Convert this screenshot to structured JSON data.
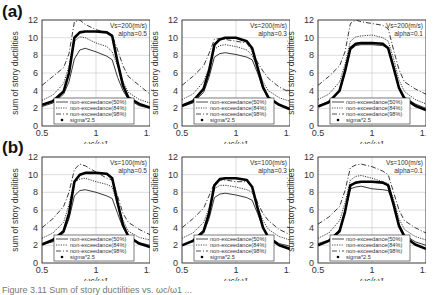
{
  "panels": [
    {
      "label": "(a)"
    },
    {
      "label": "(b)"
    }
  ],
  "caption": "Figure 3.11  Sum of story ductilities vs. ωc/ω1 ...",
  "chart_data": [
    {
      "type": "line",
      "panel": "(a)",
      "annotation": [
        "Vs=200(m/s)",
        "alpha=0.5"
      ],
      "xlabel": "ωc/ω1",
      "ylabel": "sum of story ductilities",
      "xlim": [
        0.5,
        1.5
      ],
      "ylim": [
        0,
        12
      ],
      "xticks": [
        0.5,
        1,
        1.5
      ],
      "yticks": [
        0,
        2,
        4,
        6,
        8,
        10,
        12
      ],
      "grid": true,
      "legend_position": "lower center",
      "x": [
        0.5,
        0.6,
        0.7,
        0.75,
        0.8,
        0.85,
        0.9,
        1.0,
        1.1,
        1.15,
        1.2,
        1.25,
        1.3,
        1.4,
        1.5
      ],
      "series": [
        {
          "name": "non-exceedance(50%)",
          "style": "solid",
          "values": [
            2.2,
            2.6,
            3.6,
            5.0,
            7.6,
            8.6,
            8.8,
            8.4,
            7.9,
            7.5,
            5.5,
            4.0,
            3.0,
            2.3,
            2.0
          ]
        },
        {
          "name": "non-exceedance(84%)",
          "style": "dotted",
          "values": [
            2.9,
            3.5,
            4.8,
            6.8,
            9.6,
            10.1,
            10.0,
            9.4,
            9.0,
            8.4,
            6.8,
            5.0,
            3.8,
            3.0,
            2.6
          ]
        },
        {
          "name": "non-exceedance(98%)",
          "style": "dashdot",
          "values": [
            4.6,
            5.6,
            6.6,
            8.2,
            11.8,
            12.0,
            11.5,
            10.9,
            10.6,
            10.3,
            8.6,
            6.8,
            5.6,
            4.6,
            3.6
          ]
        },
        {
          "name": "sigma*2.5",
          "style": "markers",
          "values": [
            2.4,
            2.8,
            3.9,
            6.0,
            10.0,
            10.6,
            10.7,
            10.7,
            10.6,
            10.2,
            7.2,
            4.6,
            3.2,
            2.5,
            2.1
          ]
        }
      ]
    },
    {
      "type": "line",
      "panel": "(a)",
      "annotation": [
        "Vs=200(m/s)",
        "alpha=0.3"
      ],
      "xlabel": "ωc/ω1",
      "ylabel": "sum of story ductilities",
      "xlim": [
        0.5,
        1.5
      ],
      "ylim": [
        0,
        12
      ],
      "xticks": [
        0.5,
        1,
        1.5
      ],
      "yticks": [
        0,
        2,
        4,
        6,
        8,
        10,
        12
      ],
      "grid": true,
      "legend_position": "lower center",
      "x": [
        0.5,
        0.6,
        0.7,
        0.75,
        0.8,
        0.85,
        0.9,
        1.0,
        1.1,
        1.15,
        1.2,
        1.25,
        1.3,
        1.4,
        1.5
      ],
      "series": [
        {
          "name": "non-exceedance(50%)",
          "style": "solid",
          "values": [
            2.2,
            2.6,
            3.8,
            5.5,
            7.8,
            8.2,
            8.3,
            8.1,
            7.8,
            7.5,
            6.0,
            4.2,
            3.1,
            2.4,
            2.0
          ]
        },
        {
          "name": "non-exceedance(84%)",
          "style": "dotted",
          "values": [
            3.0,
            3.6,
            5.0,
            6.6,
            8.7,
            9.1,
            9.2,
            9.0,
            8.6,
            8.0,
            6.5,
            5.0,
            4.0,
            3.2,
            2.8
          ]
        },
        {
          "name": "non-exceedance(98%)",
          "style": "dashdot",
          "values": [
            4.6,
            5.6,
            6.8,
            8.2,
            9.8,
            9.9,
            9.8,
            9.6,
            9.4,
            8.4,
            7.2,
            6.2,
            5.4,
            4.4,
            3.8
          ]
        },
        {
          "name": "sigma*2.5",
          "style": "markers",
          "values": [
            2.3,
            2.8,
            4.2,
            6.2,
            9.2,
            9.8,
            10.0,
            10.0,
            9.6,
            8.8,
            6.6,
            4.4,
            3.2,
            2.4,
            1.9
          ]
        }
      ]
    },
    {
      "type": "line",
      "panel": "(a)",
      "annotation": [
        "Vs=200(m/s)",
        "alpha=0.1"
      ],
      "xlabel": "ωc/ω1",
      "ylabel": "sum of story ductilities",
      "xlim": [
        0.5,
        1.5
      ],
      "ylim": [
        0,
        12
      ],
      "xticks": [
        0.5,
        1,
        1.5
      ],
      "yticks": [
        0,
        2,
        4,
        6,
        8,
        10,
        12
      ],
      "grid": true,
      "legend_position": "lower center",
      "x": [
        0.5,
        0.6,
        0.7,
        0.75,
        0.8,
        0.85,
        0.9,
        1.0,
        1.1,
        1.15,
        1.2,
        1.25,
        1.3,
        1.4,
        1.5
      ],
      "series": [
        {
          "name": "non-exceedance(50%)",
          "style": "solid",
          "values": [
            2.3,
            2.8,
            4.0,
            6.0,
            8.6,
            9.1,
            9.2,
            9.2,
            9.1,
            8.8,
            6.8,
            4.5,
            3.3,
            2.5,
            2.0
          ]
        },
        {
          "name": "non-exceedance(84%)",
          "style": "dotted",
          "values": [
            3.0,
            3.6,
            5.0,
            7.0,
            9.6,
            10.1,
            10.2,
            10.3,
            10.0,
            9.6,
            7.6,
            5.2,
            3.9,
            3.0,
            2.5
          ]
        },
        {
          "name": "non-exceedance(98%)",
          "style": "dashdot",
          "values": [
            4.6,
            5.6,
            6.8,
            8.4,
            11.6,
            12.0,
            11.8,
            11.6,
            11.4,
            11.0,
            8.6,
            6.4,
            5.0,
            4.2,
            3.6
          ]
        },
        {
          "name": "sigma*2.5",
          "style": "markers",
          "values": [
            2.2,
            2.7,
            4.0,
            6.2,
            8.8,
            9.3,
            9.4,
            9.4,
            9.3,
            8.8,
            6.6,
            4.3,
            3.1,
            2.3,
            1.8
          ]
        }
      ]
    },
    {
      "type": "line",
      "panel": "(b)",
      "annotation": [
        "Vs=100(m/s)",
        "alpha=0.5"
      ],
      "xlabel": "ωc/ω1",
      "ylabel": "sum of story ductilities",
      "xlim": [
        0.5,
        1.5
      ],
      "ylim": [
        0,
        12
      ],
      "xticks": [
        0.5,
        1,
        1.5
      ],
      "yticks": [
        0,
        2,
        4,
        6,
        8,
        10,
        12
      ],
      "grid": true,
      "legend_position": "lower center",
      "x": [
        0.5,
        0.6,
        0.7,
        0.75,
        0.8,
        0.85,
        0.9,
        1.0,
        1.1,
        1.15,
        1.2,
        1.25,
        1.3,
        1.4,
        1.5
      ],
      "series": [
        {
          "name": "non-exceedance(50%)",
          "style": "solid",
          "values": [
            2.1,
            2.4,
            3.4,
            5.0,
            7.6,
            8.2,
            8.3,
            8.0,
            7.6,
            7.3,
            5.6,
            4.0,
            3.0,
            2.3,
            2.0
          ]
        },
        {
          "name": "non-exceedance(84%)",
          "style": "dotted",
          "values": [
            2.8,
            3.4,
            4.6,
            6.6,
            9.2,
            9.5,
            9.6,
            9.2,
            8.9,
            8.6,
            6.6,
            4.8,
            3.6,
            2.9,
            2.6
          ]
        },
        {
          "name": "non-exceedance(98%)",
          "style": "dashdot",
          "values": [
            4.0,
            5.0,
            6.4,
            8.0,
            10.6,
            11.2,
            11.0,
            10.3,
            9.6,
            9.4,
            7.6,
            5.6,
            4.6,
            3.8,
            3.2
          ]
        },
        {
          "name": "sigma*2.5",
          "style": "markers",
          "values": [
            2.1,
            2.6,
            3.6,
            5.6,
            9.2,
            10.0,
            10.2,
            10.2,
            10.1,
            9.6,
            6.8,
            4.3,
            3.0,
            2.2,
            1.8
          ]
        }
      ]
    },
    {
      "type": "line",
      "panel": "(b)",
      "annotation": [
        "Vs=100(m/s)",
        "alpha=0.3"
      ],
      "xlabel": "ωc/ω1",
      "ylabel": "sum of story ductilities",
      "xlim": [
        0.5,
        1.5
      ],
      "ylim": [
        0,
        12
      ],
      "xticks": [
        0.5,
        1,
        1.5
      ],
      "yticks": [
        0,
        2,
        4,
        6,
        8,
        10,
        12
      ],
      "grid": true,
      "legend_position": "lower center",
      "x": [
        0.5,
        0.6,
        0.7,
        0.75,
        0.8,
        0.85,
        0.9,
        1.0,
        1.1,
        1.15,
        1.2,
        1.25,
        1.3,
        1.4,
        1.5
      ],
      "series": [
        {
          "name": "non-exceedance(50%)",
          "style": "solid",
          "values": [
            2.0,
            2.4,
            3.4,
            5.0,
            7.4,
            7.8,
            7.9,
            7.7,
            7.4,
            7.1,
            5.6,
            4.0,
            3.0,
            2.2,
            1.9
          ]
        },
        {
          "name": "non-exceedance(84%)",
          "style": "dotted",
          "values": [
            2.8,
            3.4,
            4.6,
            6.2,
            8.4,
            8.8,
            8.8,
            8.6,
            8.3,
            8.0,
            6.4,
            4.8,
            3.8,
            3.0,
            2.6
          ]
        },
        {
          "name": "non-exceedance(98%)",
          "style": "dashdot",
          "values": [
            4.0,
            5.0,
            6.2,
            7.6,
            9.0,
            9.4,
            9.4,
            9.2,
            9.2,
            8.6,
            6.8,
            5.6,
            4.8,
            3.8,
            3.2
          ]
        },
        {
          "name": "sigma*2.5",
          "style": "markers",
          "values": [
            2.0,
            2.5,
            3.6,
            5.6,
            8.8,
            9.5,
            9.6,
            9.6,
            9.4,
            8.6,
            6.2,
            4.0,
            2.9,
            2.0,
            1.6
          ]
        }
      ]
    },
    {
      "type": "line",
      "panel": "(b)",
      "annotation": [
        "Vs=100(m/s)",
        "alpha=0.1"
      ],
      "xlabel": "ωc/ω1",
      "ylabel": "sum of story ductilities",
      "xlim": [
        0.5,
        1.5
      ],
      "ylim": [
        0,
        12
      ],
      "xticks": [
        0.5,
        1,
        1.5
      ],
      "yticks": [
        0,
        2,
        4,
        6,
        8,
        10,
        12
      ],
      "grid": true,
      "legend_position": "lower center",
      "x": [
        0.5,
        0.6,
        0.7,
        0.75,
        0.8,
        0.85,
        0.9,
        1.0,
        1.1,
        1.15,
        1.2,
        1.25,
        1.3,
        1.4,
        1.5
      ],
      "series": [
        {
          "name": "non-exceedance(50%)",
          "style": "solid",
          "values": [
            2.2,
            2.6,
            3.8,
            5.8,
            8.4,
            8.6,
            8.7,
            8.4,
            8.3,
            8.2,
            6.8,
            4.4,
            3.2,
            2.4,
            2.0
          ]
        },
        {
          "name": "non-exceedance(84%)",
          "style": "dotted",
          "values": [
            2.8,
            3.4,
            4.8,
            6.8,
            9.4,
            9.8,
            9.9,
            9.6,
            9.2,
            9.0,
            7.2,
            5.0,
            3.8,
            3.0,
            2.6
          ]
        },
        {
          "name": "non-exceedance(98%)",
          "style": "dashdot",
          "values": [
            4.4,
            5.2,
            6.4,
            8.2,
            10.8,
            11.1,
            11.2,
            10.9,
            10.4,
            10.0,
            8.0,
            6.0,
            4.8,
            4.0,
            3.4
          ]
        },
        {
          "name": "sigma*2.5",
          "style": "markers",
          "values": [
            2.0,
            2.5,
            3.6,
            5.8,
            8.8,
            9.1,
            9.2,
            9.2,
            9.1,
            8.8,
            6.6,
            4.2,
            3.0,
            2.1,
            1.6
          ]
        }
      ]
    }
  ]
}
